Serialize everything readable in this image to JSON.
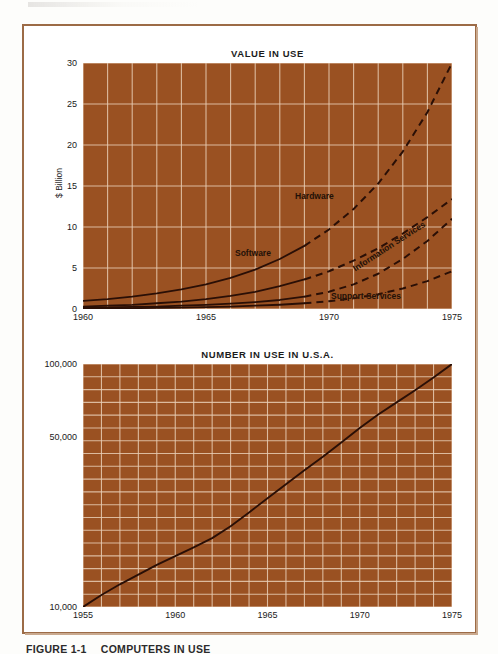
{
  "figure": {
    "caption_number": "FIGURE 1-1",
    "caption_text": "COMPUTERS IN USE",
    "frame_color": "#9c6b46",
    "page_background": "#fdfdfb"
  },
  "palette": {
    "plot_fill": "#9a5122",
    "gridline": "#e8cdb4",
    "curve": "#2a0f06",
    "text": "#1a1a1a"
  },
  "chart_data": [
    {
      "type": "line",
      "id": "value-in-use",
      "title": "VALUE IN USE",
      "xlabel": "",
      "ylabel": "$ Billion",
      "xlim": [
        1960,
        1975
      ],
      "ylim": [
        0,
        30
      ],
      "xticks": [
        "1960",
        "1965",
        "1970",
        "1975"
      ],
      "xtick_values": [
        1960,
        1965,
        1970,
        1975
      ],
      "yticks": [
        "0",
        "5",
        "10",
        "15",
        "20",
        "25",
        "30"
      ],
      "ytick_values": [
        0,
        5,
        10,
        15,
        20,
        25,
        30
      ],
      "grid": true,
      "grid_x_step": 1,
      "grid_y_step": 5,
      "legend_position": "inline-labels",
      "series": [
        {
          "name": "Hardware",
          "style": "solid-then-dashed",
          "dash_from_x": 1969,
          "x": [
            1960,
            1961,
            1962,
            1963,
            1964,
            1965,
            1966,
            1967,
            1968,
            1969,
            1970,
            1971,
            1972,
            1973,
            1974,
            1975
          ],
          "values": [
            1.0,
            1.2,
            1.5,
            1.9,
            2.4,
            3.0,
            3.8,
            4.8,
            6.1,
            7.7,
            9.7,
            12.2,
            15.3,
            19.2,
            24.0,
            30.0
          ]
        },
        {
          "name": "Software",
          "style": "solid-then-dashed",
          "dash_from_x": 1969,
          "x": [
            1960,
            1961,
            1962,
            1963,
            1964,
            1965,
            1966,
            1967,
            1968,
            1969,
            1970,
            1971,
            1972,
            1973,
            1974,
            1975
          ],
          "values": [
            0.3,
            0.4,
            0.5,
            0.7,
            0.9,
            1.2,
            1.6,
            2.1,
            2.8,
            3.6,
            4.6,
            5.9,
            7.4,
            9.2,
            11.2,
            13.4
          ]
        },
        {
          "name": "Information Services",
          "style": "solid-then-dashed",
          "dash_from_x": 1969,
          "x": [
            1960,
            1961,
            1962,
            1963,
            1964,
            1965,
            1966,
            1967,
            1968,
            1969,
            1970,
            1971,
            1972,
            1973,
            1974,
            1975
          ],
          "values": [
            0.15,
            0.2,
            0.25,
            0.3,
            0.4,
            0.5,
            0.65,
            0.85,
            1.1,
            1.5,
            2.1,
            3.0,
            4.3,
            6.1,
            8.3,
            11.0
          ]
        },
        {
          "name": "Support Services",
          "style": "solid-then-dashed",
          "dash_from_x": 1969,
          "x": [
            1960,
            1961,
            1962,
            1963,
            1964,
            1965,
            1966,
            1967,
            1968,
            1969,
            1970,
            1971,
            1972,
            1973,
            1974,
            1975
          ],
          "values": [
            0.05,
            0.07,
            0.1,
            0.13,
            0.17,
            0.22,
            0.3,
            0.4,
            0.52,
            0.7,
            0.95,
            1.3,
            1.8,
            2.5,
            3.4,
            4.6
          ]
        }
      ]
    },
    {
      "type": "line",
      "id": "number-in-use",
      "title": "NUMBER IN USE IN U.S.A.",
      "xlabel": "",
      "ylabel": "",
      "xlim": [
        1955,
        1975
      ],
      "ylim": [
        10000,
        100000
      ],
      "yscale": "log",
      "xticks": [
        "1955",
        "1960",
        "1965",
        "1970",
        "1975"
      ],
      "xtick_values": [
        1955,
        1960,
        1965,
        1970,
        1975
      ],
      "yticks": [
        "10,000",
        "50,000",
        "100,000"
      ],
      "ytick_values": [
        10000,
        50000,
        100000
      ],
      "grid": true,
      "grid_x_step": 1,
      "grid_rows": 19,
      "legend_position": "none",
      "series": [
        {
          "name": "Computers in use",
          "style": "solid",
          "x": [
            1955,
            1956,
            1957,
            1958,
            1959,
            1960,
            1961,
            1962,
            1963,
            1964,
            1965,
            1966,
            1967,
            1968,
            1969,
            1970,
            1971,
            1972,
            1973,
            1974,
            1975
          ],
          "values": [
            10000,
            11200,
            12400,
            13600,
            14900,
            16200,
            17600,
            19200,
            21500,
            24500,
            28000,
            32000,
            36500,
            41500,
            47500,
            54500,
            62000,
            69500,
            78000,
            88000,
            100000
          ]
        }
      ]
    }
  ]
}
